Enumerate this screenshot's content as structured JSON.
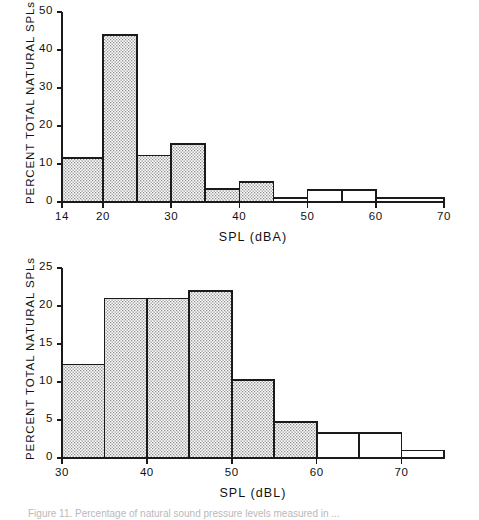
{
  "figure": {
    "caption": "Figure 11.  Percentage of natural sound pressure levels measured in ..."
  },
  "chart_data": [
    {
      "id": "top",
      "type": "bar",
      "title": "",
      "xlabel": "SPL (dBA)",
      "ylabel": "PERCENT TOTAL NATURAL SPLs",
      "xlim": [
        14,
        70
      ],
      "ylim": [
        0,
        50
      ],
      "xticks": [
        14,
        20,
        30,
        40,
        50,
        60,
        70
      ],
      "xtick_labels": [
        "14",
        "20",
        "30",
        "40",
        "50",
        "60",
        "70"
      ],
      "yticks": [
        0,
        10,
        20,
        30,
        40,
        50
      ],
      "ytick_labels": [
        "0",
        "10",
        "20",
        "30",
        "40",
        "50"
      ],
      "grid": false,
      "legend": "none",
      "bin_edges": [
        14,
        20,
        25,
        30,
        35,
        40,
        45,
        50,
        55,
        60,
        70
      ],
      "categories": [
        "14-20",
        "20-25",
        "25-30",
        "30-35",
        "35-40",
        "40-45",
        "45-50",
        "50-55",
        "55-60",
        "60-70"
      ],
      "values": [
        11.5,
        44,
        12.2,
        15.3,
        3.5,
        5.2,
        1.0,
        3.1,
        3.1,
        1.0
      ],
      "fills": [
        "stipple",
        "stipple",
        "stipple",
        "stipple",
        "stipple",
        "stipple",
        "white",
        "white",
        "white",
        "white"
      ]
    },
    {
      "id": "bottom",
      "type": "bar",
      "title": "",
      "xlabel": "SPL (dBL)",
      "ylabel": "PERCENT TOTAL NATURAL SPLs",
      "xlim": [
        30,
        75
      ],
      "ylim": [
        0,
        25
      ],
      "xticks": [
        30,
        40,
        50,
        60,
        70
      ],
      "xtick_labels": [
        "30",
        "40",
        "50",
        "60",
        "70"
      ],
      "yticks": [
        0,
        5,
        10,
        15,
        20,
        25
      ],
      "ytick_labels": [
        "0",
        "5",
        "10",
        "15",
        "20",
        "25"
      ],
      "grid": false,
      "legend": "none",
      "bin_edges": [
        30,
        35,
        40,
        45,
        50,
        55,
        60,
        65,
        70,
        75
      ],
      "categories": [
        "30-35",
        "35-40",
        "40-45",
        "45-50",
        "50-55",
        "55-60",
        "60-65",
        "65-70",
        "70-75"
      ],
      "values": [
        12.3,
        21.0,
        21.0,
        22.0,
        10.3,
        4.7,
        3.3,
        3.3,
        1.0
      ],
      "fills": [
        "stipple",
        "stipple",
        "stipple",
        "stipple",
        "stipple",
        "stipple",
        "white",
        "white",
        "white"
      ]
    }
  ]
}
